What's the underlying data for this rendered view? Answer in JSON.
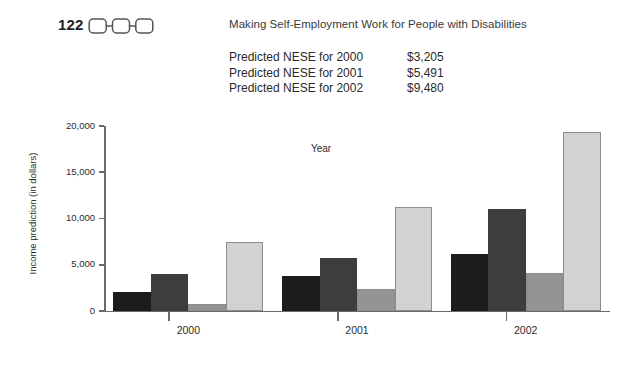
{
  "header": {
    "folio": "122",
    "running_head": "Making Self-Employment Work for People with Disabilities",
    "ornament_icon": "three-linked-rounded-squares-icon"
  },
  "predictions": {
    "rows": [
      {
        "label": "Predicted NESE for 2000",
        "value": "$3,205"
      },
      {
        "label": "Predicted NESE for 2001",
        "value": "$5,491"
      },
      {
        "label": "Predicted NESE for 2002",
        "value": "$9,480"
      }
    ]
  },
  "chart_data": {
    "type": "bar",
    "title": "",
    "xlabel": "Year",
    "ylabel": "Income prediction (in dollars)",
    "categories": [
      "2000",
      "2001",
      "2002"
    ],
    "ylim": [
      0,
      20000
    ],
    "yticks": [
      0,
      5000,
      10000,
      15000,
      20000
    ],
    "ytick_labels": [
      "0",
      "5,000",
      "10,000",
      "15,000",
      "20,000"
    ],
    "grid": false,
    "legend": "none",
    "series": [
      {
        "name": "series-1",
        "color": "#1c1c1c",
        "values": [
          2100,
          3800,
          6200
        ]
      },
      {
        "name": "series-2",
        "color": "#3d3d3d",
        "values": [
          4000,
          5700,
          11000
        ]
      },
      {
        "name": "series-3",
        "color": "#949494",
        "values": [
          800,
          2400,
          4100
        ]
      },
      {
        "name": "series-4",
        "color": "#d2d2d2",
        "values": [
          7500,
          11200,
          19400
        ]
      }
    ]
  }
}
